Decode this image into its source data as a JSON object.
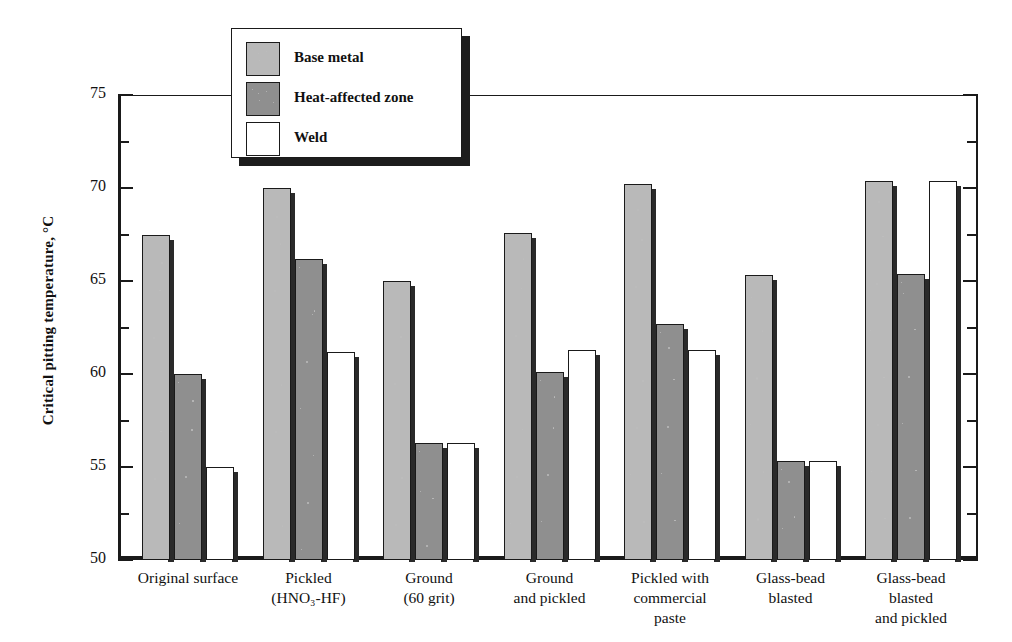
{
  "chart_data": {
    "type": "bar",
    "title": "",
    "xlabel": "",
    "ylabel": "Critical pitting temperature, °C",
    "ylim": [
      50,
      75
    ],
    "ytick_labels": [
      "75",
      "70",
      "65",
      "60",
      "55",
      "50"
    ],
    "ytick_values": [
      75,
      70,
      65,
      60,
      55,
      50
    ],
    "yminor_values": [
      72.5,
      67.5,
      62.5,
      57.5,
      52.5
    ],
    "grid": false,
    "legend_position": "top-left-inside",
    "categories": [
      "Original surface",
      "Pickled\n(HNO₃-HF)",
      "Ground\n(60 grit)",
      "Ground\nand pickled",
      "Pickled with\ncommercial\npaste",
      "Glass-bead\nblasted",
      "Glass-bead\nblasted\nand pickled"
    ],
    "series": [
      {
        "name": "Base metal",
        "color": "#b9b9b9",
        "values": [
          67.5,
          70.0,
          65.0,
          67.6,
          70.2,
          65.3,
          70.4
        ]
      },
      {
        "name": "Heat-affected zone",
        "color": "#8f8f8f",
        "values": [
          60.0,
          66.2,
          56.3,
          60.1,
          62.7,
          55.3,
          65.4
        ]
      },
      {
        "name": "Weld",
        "color": "#ffffff",
        "values": [
          55.0,
          61.2,
          56.3,
          61.3,
          61.3,
          55.3,
          70.4
        ]
      }
    ]
  },
  "legend": {
    "items": [
      {
        "label": "Base metal"
      },
      {
        "label": "Heat-affected zone"
      },
      {
        "label": "Weld"
      }
    ]
  }
}
